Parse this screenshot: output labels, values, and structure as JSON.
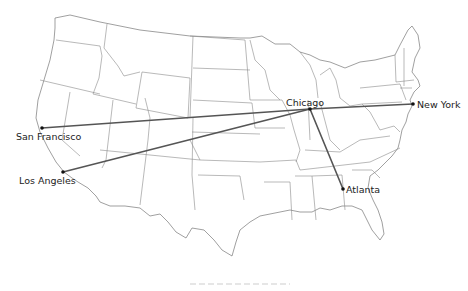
{
  "map": {
    "title": "",
    "region": "United States",
    "route_color": "#555555",
    "dot_color": "#111111",
    "border_color": "#8a8a8a",
    "hub": "Chicago",
    "cities": [
      {
        "name": "Chicago",
        "x": 310,
        "y": 109,
        "label_x": 286,
        "label_y": 106
      },
      {
        "name": "New York",
        "x": 413,
        "y": 104,
        "label_x": 417,
        "label_y": 108
      },
      {
        "name": "San Francisco",
        "x": 42,
        "y": 128,
        "label_x": 16,
        "label_y": 140
      },
      {
        "name": "Los Angeles",
        "x": 63,
        "y": 172,
        "label_x": 19,
        "label_y": 184
      },
      {
        "name": "Atlanta",
        "x": 343,
        "y": 189,
        "label_x": 346,
        "label_y": 193
      }
    ],
    "routes": [
      {
        "from": "Chicago",
        "to": "New York"
      },
      {
        "from": "Chicago",
        "to": "San Francisco"
      },
      {
        "from": "Chicago",
        "to": "Los Angeles"
      },
      {
        "from": "Chicago",
        "to": "Atlanta"
      }
    ]
  }
}
